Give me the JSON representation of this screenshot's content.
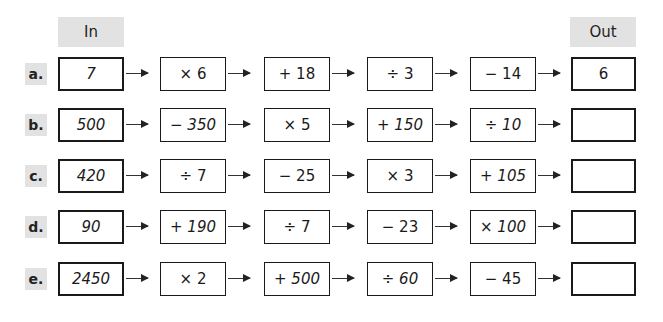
{
  "headers": {
    "in": "In",
    "out": "Out"
  },
  "colors": {
    "header_bg": "#e2e2e2",
    "border": "#1a1a1a"
  },
  "rows": [
    {
      "label": "a.",
      "input": "7",
      "ops": [
        "× 6",
        "+ 18",
        "÷ 3",
        "− 14"
      ],
      "output": "6"
    },
    {
      "label": "b.",
      "input": "500",
      "ops": [
        "− 350",
        "× 5",
        "+ 150",
        "÷ 10"
      ],
      "output": ""
    },
    {
      "label": "c.",
      "input": "420",
      "ops": [
        "÷ 7",
        "− 25",
        "× 3",
        "+ 105"
      ],
      "output": ""
    },
    {
      "label": "d.",
      "input": "90",
      "ops": [
        "+ 190",
        "÷ 7",
        "− 23",
        "× 100"
      ],
      "output": ""
    },
    {
      "label": "e.",
      "input": "2450",
      "ops": [
        "× 2",
        "+ 500",
        "÷ 60",
        "− 45"
      ],
      "output": ""
    }
  ]
}
